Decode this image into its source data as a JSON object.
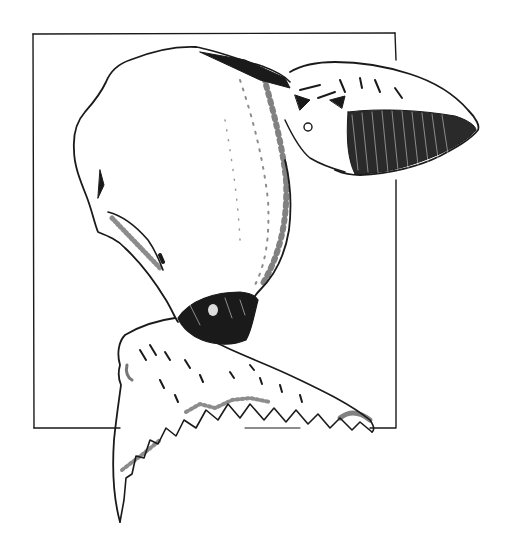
{
  "illustration": {
    "subject": "pen-and-ink whale breaking out of a rectangular frame",
    "colors": {
      "background": "#ffffff",
      "ink": "#1a1a1a"
    },
    "parts": [
      "frame",
      "whale-body",
      "whale-head",
      "whale-neck-band",
      "whale-flukes"
    ]
  }
}
